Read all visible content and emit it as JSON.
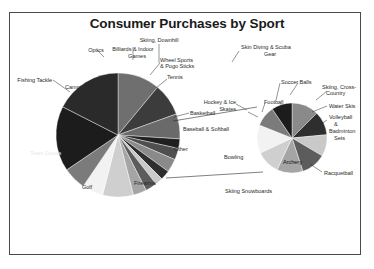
{
  "chart_data": {
    "type": "pie",
    "title": "Consumer Purchases by Sport",
    "subtitle": "",
    "xlabel": "",
    "ylabel": "",
    "legend_position": "none",
    "grid": false,
    "note": "Main pie with an exploded 'Other' slice expanded into a secondary pie at right (bar-of-pie style).",
    "categories": [
      "Team Goods",
      "Fishing Tackle",
      "Camping",
      "Optics",
      "Billiards & Indoor Games",
      "Skiing, Downhill",
      "Wheel Sports & Pogo Sticks",
      "Tennis",
      "Basketball",
      "Baseball & Softball",
      "Other",
      "Bowling",
      "Skiing Snowboards",
      "Firearms",
      "Golf"
    ],
    "values": [
      11.0,
      8.5,
      6.5,
      2.5,
      3.0,
      3.5,
      2.5,
      2.0,
      3.0,
      3.5,
      8.0,
      5.5,
      6.0,
      17.0,
      17.5
    ],
    "secondary_pie": {
      "title": "Other",
      "categories": [
        "Skin Diving & Scuba Gear",
        "Soccer Balls",
        "Skiing, Cross-Country",
        "Water Skis",
        "Volleyball & Badminton Sets",
        "Racquetball",
        "Archery",
        "Hockey & Ice Skates",
        "Football"
      ],
      "values": [
        12.5,
        11.0,
        10.0,
        11.5,
        12.0,
        11.0,
        13.0,
        9.5,
        9.5
      ]
    },
    "colors": {
      "background": "#ffffff",
      "frame": "#4a4a4a",
      "title": "#1a1a1a",
      "leader_line": "#2b2b2b",
      "slices": [
        "#6f6f6f",
        "#3c3c3c",
        "#6a6a6a",
        "#202020",
        "#4f4f4f",
        "#8a8a8a",
        "#2e2e2e",
        "#c9c9c9",
        "#5c5c5c",
        "#a5a5a5",
        "#cfcfcf",
        "#f2f2f2",
        "#7b7b7b",
        "#1c1c1c",
        "#2a2a2a"
      ]
    }
  },
  "labels": {
    "optics": "Optics",
    "billiards": "Billiards & Indoor",
    "billiards2": "Games",
    "skiing_downhill": "Skiing, Downhill",
    "fishing_tackle": "Fishing Tackle",
    "camping": "Camping",
    "wheel_sports": "Wheel Sports",
    "wheel_sports2": "& Pogo Sticks",
    "tennis": "Tennis",
    "basketball": "Basketball",
    "baseball": "Baseball & Softball",
    "other": "Other",
    "team_goods": "Team Goods",
    "bowling": "Bowling",
    "skiing_snowboards": "Skiing Snowboards",
    "firearms": "Firearms",
    "golf": "Golf",
    "skin_diving": "Skin Diving & Scuba",
    "skin_diving2": "Gear",
    "soccer_balls": "Soccer Balls",
    "football": "Football",
    "hockey": "Hockey & Ice",
    "hockey2": "Skates",
    "skiing_cross": "Skiing, Cross-",
    "skiing_cross2": "Country",
    "water_skis": "Water Skis",
    "volleyball": "Volleyball",
    "volleyball2": "&",
    "volleyball3": "Badminton",
    "volleyball4": "Sets",
    "racquetball": "Racquetball",
    "archery": "Archery"
  }
}
